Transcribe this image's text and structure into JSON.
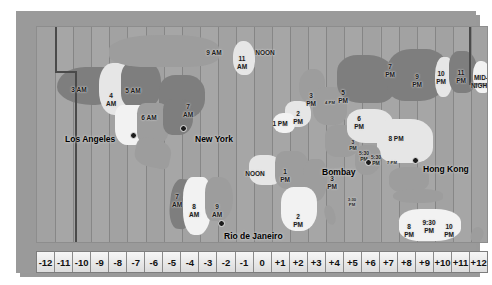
{
  "map": {
    "title": "World Time Zone Map",
    "colors": {
      "plate": "#9a9a9a",
      "ocean": "#a6a6a6",
      "land_dark": "#7e7e7e",
      "land_mid": "#9d9d9d",
      "land_light": "#e6e6e6",
      "marker": "#1c1c1c",
      "scale_bg": "#ededed"
    },
    "cities": [
      {
        "name": "Los Angeles",
        "label_x": 28,
        "label_y": 107,
        "dot_x": 96,
        "dot_y": 108,
        "label_align": "left"
      },
      {
        "name": "New York",
        "label_x": 158,
        "label_y": 107,
        "dot_x": 146,
        "dot_y": 101,
        "label_align": "left"
      },
      {
        "name": "Rio de Janeiro",
        "label_x": 187,
        "label_y": 204,
        "dot_x": 184,
        "dot_y": 196,
        "label_align": "left"
      },
      {
        "name": "Bombay",
        "label_x": 285,
        "label_y": 140,
        "dot_x": 331,
        "dot_y": 135,
        "label_align": "left"
      },
      {
        "name": "Hong Kong",
        "label_x": 386,
        "label_y": 137,
        "dot_x": 378,
        "dot_y": 133,
        "label_align": "left"
      }
    ],
    "time_labels": [
      {
        "text": "3 AM",
        "x": 42,
        "y": 59,
        "size": "normal"
      },
      {
        "text": "4\nAM",
        "x": 74,
        "y": 65,
        "size": "normal"
      },
      {
        "text": "5 AM",
        "x": 96,
        "y": 60,
        "size": "normal"
      },
      {
        "text": "6 AM",
        "x": 112,
        "y": 87,
        "size": "normal"
      },
      {
        "text": "7\nAM",
        "x": 151,
        "y": 76,
        "size": "normal"
      },
      {
        "text": "9 AM",
        "x": 177,
        "y": 22,
        "size": "normal"
      },
      {
        "text": "11\nAM",
        "x": 205,
        "y": 28,
        "size": "normal"
      },
      {
        "text": "NOON",
        "x": 228,
        "y": 22,
        "size": "normal"
      },
      {
        "text": "7\nAM",
        "x": 140,
        "y": 166,
        "size": "normal"
      },
      {
        "text": "8\nAM",
        "x": 157,
        "y": 176,
        "size": "normal"
      },
      {
        "text": "9\nAM",
        "x": 180,
        "y": 176,
        "size": "normal"
      },
      {
        "text": "NOON",
        "x": 218,
        "y": 143,
        "size": "normal"
      },
      {
        "text": "1\nPM",
        "x": 248,
        "y": 141,
        "size": "normal"
      },
      {
        "text": "2\nPM",
        "x": 261,
        "y": 186,
        "size": "normal"
      },
      {
        "text": "1 PM",
        "x": 243,
        "y": 93,
        "size": "normal"
      },
      {
        "text": "2\nPM",
        "x": 261,
        "y": 83,
        "size": "normal"
      },
      {
        "text": "3\nPM",
        "x": 274,
        "y": 65,
        "size": "normal"
      },
      {
        "text": "4 PM",
        "x": 293,
        "y": 74,
        "size": "tiny"
      },
      {
        "text": "5\nPM",
        "x": 306,
        "y": 62,
        "size": "normal"
      },
      {
        "text": "6\nPM",
        "x": 322,
        "y": 88,
        "size": "normal"
      },
      {
        "text": "3\nPM",
        "x": 316,
        "y": 113,
        "size": "small"
      },
      {
        "text": "3\nPM",
        "x": 295,
        "y": 148,
        "size": "normal"
      },
      {
        "text": "3:30\nPM",
        "x": 315,
        "y": 171,
        "size": "tiny"
      },
      {
        "text": "5:30\nPM",
        "x": 327,
        "y": 124,
        "size": "small"
      },
      {
        "text": "5:30\nPM",
        "x": 339,
        "y": 128,
        "size": "small"
      },
      {
        "text": "7\nPM",
        "x": 353,
        "y": 36,
        "size": "normal"
      },
      {
        "text": "9\nPM",
        "x": 380,
        "y": 46,
        "size": "normal"
      },
      {
        "text": "10\nPM",
        "x": 404,
        "y": 43,
        "size": "normal"
      },
      {
        "text": "11\nPM",
        "x": 424,
        "y": 42,
        "size": "normal"
      },
      {
        "text": "MID-\nNIGHT",
        "x": 444,
        "y": 47,
        "size": "normal"
      },
      {
        "text": "8 PM",
        "x": 359,
        "y": 108,
        "size": "normal"
      },
      {
        "text": "7 PM",
        "x": 355,
        "y": 134,
        "size": "tiny"
      },
      {
        "text": "8\nPM",
        "x": 372,
        "y": 196,
        "size": "normal"
      },
      {
        "text": "9:30\nPM",
        "x": 392,
        "y": 192,
        "size": "normal"
      },
      {
        "text": "10\nPM",
        "x": 412,
        "y": 196,
        "size": "normal"
      }
    ],
    "scale": {
      "name": "time-zone-offset-scale",
      "offsets": [
        "-12",
        "-11",
        "-10",
        "-9",
        "-8",
        "-7",
        "-6",
        "-5",
        "-4",
        "-3",
        "-2",
        "-1",
        "0",
        "+1",
        "+2",
        "+3",
        "+4",
        "+5",
        "+6",
        "+7",
        "+8",
        "+9",
        "+10",
        "+11",
        "+12"
      ]
    }
  }
}
